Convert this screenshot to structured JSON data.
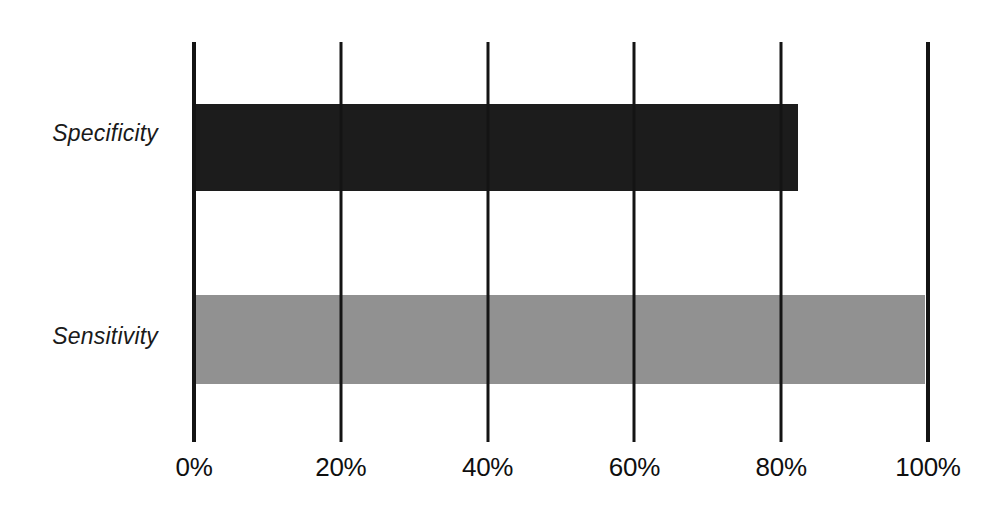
{
  "chart_data": {
    "type": "bar",
    "orientation": "horizontal",
    "title": "",
    "subtitle": "",
    "xlabel": "",
    "ylabel": "",
    "categories": [
      "Specificity",
      "Sensitivity"
    ],
    "values": [
      82.3,
      99.6
    ],
    "value_unit": "%",
    "xlim": [
      0,
      100
    ],
    "x_ticks": [
      0,
      20,
      40,
      60,
      80,
      100
    ],
    "x_tick_labels": [
      "0%",
      "20%",
      "40%",
      "60%",
      "80%",
      "100%"
    ],
    "grid": true,
    "grid_axis": "x",
    "legend": false,
    "legend_position": "none",
    "bar_colors": [
      "#1c1c1c",
      "#919191"
    ],
    "series": [
      {
        "name": "Specificity",
        "value": 82.3,
        "color": "#1c1c1c",
        "label": "Specificity"
      },
      {
        "name": "Sensitivity",
        "value": 99.6,
        "color": "#919191",
        "label": "Sensitivity"
      }
    ],
    "axis_color": "#141414",
    "background": "#ffffff"
  },
  "axis": {
    "tick_0": "0%",
    "tick_20": "20%",
    "tick_40": "40%",
    "tick_60": "60%",
    "tick_80": "80%",
    "tick_100": "100%"
  },
  "categories": {
    "specificity": "Specificity",
    "sensitivity": "Sensitivity"
  }
}
